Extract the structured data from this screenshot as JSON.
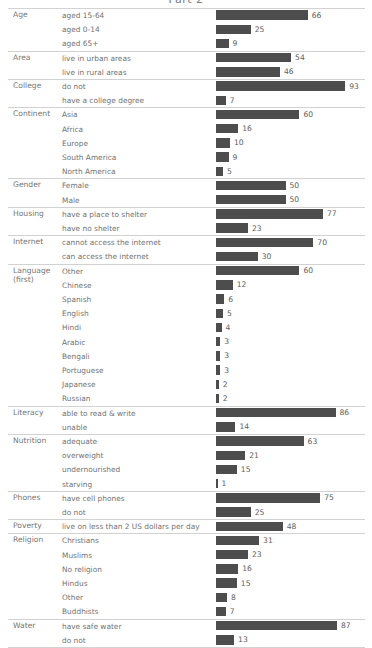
{
  "title": "Part 2",
  "axis": {
    "bar_origin_px": 216,
    "px_per_unit": 1.39,
    "max_value": 100
  },
  "colors": {
    "bar": "#4d4d4d",
    "rule": "#d2d2d2",
    "text": "#737373",
    "value_text": "#5e5e5e",
    "background": "#ffffff"
  },
  "chart_data": {
    "type": "bar",
    "title": "Part 2",
    "xlabel": "",
    "ylabel": "",
    "xlim": [
      0,
      100
    ],
    "grid": false,
    "legend": null,
    "orientation": "horizontal",
    "value_unit": "percent of world population",
    "groups": [
      {
        "category": "Age",
        "items": [
          {
            "label": "aged 15-64",
            "value": 66
          },
          {
            "label": "aged 0-14",
            "value": 25
          },
          {
            "label": "aged 65+",
            "value": 9
          }
        ]
      },
      {
        "category": "Area",
        "items": [
          {
            "label": "live in urban areas",
            "value": 54
          },
          {
            "label": "live in rural areas",
            "value": 46
          }
        ]
      },
      {
        "category": "College",
        "items": [
          {
            "label": "do not",
            "value": 93
          },
          {
            "label": "have a college degree",
            "value": 7
          }
        ]
      },
      {
        "category": "Continent",
        "items": [
          {
            "label": "Asia",
            "value": 60
          },
          {
            "label": "Africa",
            "value": 16
          },
          {
            "label": "Europe",
            "value": 10
          },
          {
            "label": "South America",
            "value": 9
          },
          {
            "label": "North America",
            "value": 5
          }
        ]
      },
      {
        "category": "Gender",
        "items": [
          {
            "label": "Female",
            "value": 50
          },
          {
            "label": "Male",
            "value": 50
          }
        ]
      },
      {
        "category": "Housing",
        "items": [
          {
            "label": "have a place to shelter",
            "value": 77
          },
          {
            "label": "have no shelter",
            "value": 23
          }
        ]
      },
      {
        "category": "Internet",
        "items": [
          {
            "label": "cannot access the internet",
            "value": 70
          },
          {
            "label": "can access the internet",
            "value": 30
          }
        ]
      },
      {
        "category": "Language\n(first)",
        "items": [
          {
            "label": "Other",
            "value": 60
          },
          {
            "label": "Chinese",
            "value": 12
          },
          {
            "label": "Spanish",
            "value": 6
          },
          {
            "label": "English",
            "value": 5
          },
          {
            "label": "Hindi",
            "value": 4
          },
          {
            "label": "Arabic",
            "value": 3
          },
          {
            "label": "Bengali",
            "value": 3
          },
          {
            "label": "Portuguese",
            "value": 3
          },
          {
            "label": "Japanese",
            "value": 2
          },
          {
            "label": "Russian",
            "value": 2
          }
        ]
      },
      {
        "category": "Literacy",
        "items": [
          {
            "label": "able to read & write",
            "value": 86
          },
          {
            "label": "unable",
            "value": 14
          }
        ]
      },
      {
        "category": "Nutrition",
        "items": [
          {
            "label": "adequate",
            "value": 63
          },
          {
            "label": "overweight",
            "value": 21
          },
          {
            "label": "undernourished",
            "value": 15
          },
          {
            "label": "starving",
            "value": 1
          }
        ]
      },
      {
        "category": "Phones",
        "items": [
          {
            "label": "have cell phones",
            "value": 75
          },
          {
            "label": "do not",
            "value": 25
          }
        ]
      },
      {
        "category": "Poverty",
        "items": [
          {
            "label": "live on less than 2 US dollars per day",
            "value": 48
          }
        ]
      },
      {
        "category": "Religion",
        "items": [
          {
            "label": "Christians",
            "value": 31
          },
          {
            "label": "Muslims",
            "value": 23
          },
          {
            "label": "No religion",
            "value": 16
          },
          {
            "label": "Hindus",
            "value": 15
          },
          {
            "label": "Other",
            "value": 8
          },
          {
            "label": "Buddhists",
            "value": 7
          }
        ]
      },
      {
        "category": "Water",
        "items": [
          {
            "label": "have safe water",
            "value": 87
          },
          {
            "label": "do not",
            "value": 13
          }
        ]
      }
    ]
  }
}
